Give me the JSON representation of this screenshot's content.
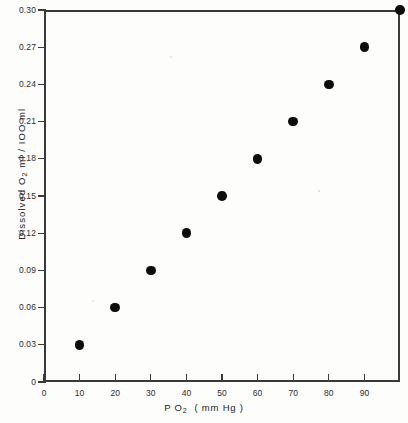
{
  "figure": {
    "background_color": "#fdfdfb",
    "ink_color": "#2b2b2b",
    "marker_color": "#0d0d0d"
  },
  "chart_data": {
    "type": "scatter",
    "title": "",
    "xlabel": "P O2  ( mm Hg )",
    "xlabel_main": "P O",
    "xlabel_sub": "2",
    "xlabel_units": "( mm Hg )",
    "ylabel": "Dissolved O2 ml / IOO ml",
    "ylabel_pre": "Dissolved  O",
    "ylabel_sub": "2",
    "ylabel_post": "ml / IOO ml",
    "xlim": [
      0,
      100
    ],
    "ylim": [
      0,
      0.3
    ],
    "grid": false,
    "legend": null,
    "x": [
      10,
      20,
      30,
      40,
      50,
      60,
      70,
      80,
      90,
      100
    ],
    "y": [
      0.03,
      0.06,
      0.09,
      0.12,
      0.15,
      0.18,
      0.21,
      0.24,
      0.27,
      0.3
    ],
    "xticks": [
      0,
      10,
      20,
      30,
      40,
      50,
      60,
      70,
      80,
      90
    ],
    "xticklabels": [
      "0",
      "10",
      "20",
      "30",
      "40",
      "50",
      "60",
      "70",
      "80",
      "90"
    ],
    "yticks": [
      0,
      0.03,
      0.06,
      0.09,
      0.12,
      0.15,
      0.18,
      0.21,
      0.24,
      0.27,
      0.3
    ],
    "yticklabels": [
      "0",
      "0.03",
      "0.06",
      "0.09",
      "0.12",
      "0.15",
      "0.18",
      "0.21",
      "0.24",
      "0.27",
      "0.30"
    ]
  }
}
